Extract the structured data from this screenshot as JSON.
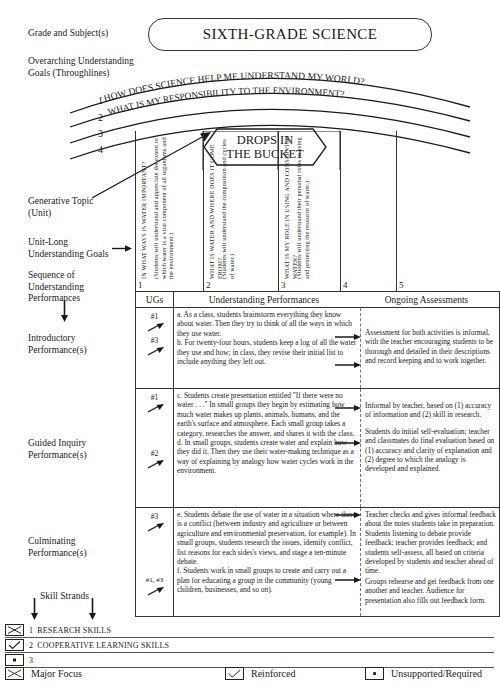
{
  "labels": {
    "grade_subject": "Grade and Subject(s)",
    "overarching": "Overarching Understanding\nGoals (Throughlines)",
    "generative_topic": "Generative Topic\n(Unit)",
    "unit_long": "Unit-Long\nUnderstanding Goals",
    "sequence": "Sequence of\nUnderstanding\nPerformances",
    "introductory": "Introductory\nPerformance(s)",
    "guided": "Guided Inquiry\nPerformance(s)",
    "culminating": "Culminating\nPerformance(s)",
    "skill_strands": "Skill Strands"
  },
  "title": "SIXTH-GRADE SCIENCE",
  "throughlines": {
    "numbers": [
      "1",
      "2",
      "3",
      "4"
    ],
    "arc_texts": [
      "HOW DOES SCIENCE HELP ME UNDERSTAND MY WORLD?",
      "WHAT IS MY RESPONSIBILITY TO THE ENVIRONMENT?"
    ]
  },
  "generative_topic": {
    "line1": "DROPS IN",
    "line2": "THE BUCKET"
  },
  "understanding_goals": [
    {
      "number": "1",
      "question": "IN WHAT WAYS IS WATER IMPORTANT?",
      "detail": "(Students will understand and appreciate the extent to which water is a vital component of all organisms and the environment.)"
    },
    {
      "number": "2",
      "question": "WHAT IS WATER AND WHERE DOES IT COME FROM?",
      "detail": "(Students will understand the composition and cycles of water.)"
    },
    {
      "number": "3",
      "question": "WHAT IS MY ROLE IN USING AND CONSERVING WATER?",
      "detail": "(Students will understand their personal roles in using and protecting the resource of water.)"
    },
    {
      "number": "4",
      "question": "",
      "detail": ""
    },
    {
      "number": "5",
      "question": "",
      "detail": ""
    }
  ],
  "table": {
    "headers": {
      "ugs": "UGs",
      "performances": "Understanding Performances",
      "assessments": "Ongoing Assessments"
    },
    "rows": [
      {
        "ug_marks": [
          "#1",
          "#3"
        ],
        "performance": "a. As a class, students brainstorm everything they know about water. Then they try to think of all the ways in which they use water.\nb. For twenty-four hours, students keep a log of all the water they use and how; in class, they revise their initial list to include anything they left out.",
        "assessments": [
          "Assessment for both activities is informal, with the teacher encouraging students to be thorough and detailed in their descriptions and record keeping and to work together."
        ]
      },
      {
        "ug_marks": [
          "#1",
          "#2"
        ],
        "performance": "c. Students create presentation entitled \"If there were no water . . .\" In small groups they begin by estimating how much water makes up plants, animals, humans, and the earth's surface and atmosphere. Each small group takes a category, researches the answer, and shares it with the class.\nd. In small groups, students create water and explain how they did it. Then they use their water-making technique as a way of explaining by analogy how water cycles work in the environment.",
        "assessments": [
          "Informal by teacher, based on (1) accuracy of information and (2) skill in research.",
          "Students do initial self-evaluation; teacher and classmates do final evaluation based on (1) accuracy and clarity of explanation and (2) degree to which the analogy is developed and explained."
        ]
      },
      {
        "ug_marks": [
          "#3",
          "#1, #3"
        ],
        "performance": "e. Students debate the use of water in a situation where there is a conflict (between industry and agriculture or between agriculture and environmental preservation, for example). In small groups, students research the issues, identify conflict, list reasons for each sides's views, and stage a ten-minute debate.\nf. Students work in small groups to create and carry out a plan for educating a group in the community (young children, businesses, and so on).",
        "assessments": [
          "Teacher checks and gives informal feedback about the notes students take in preparation. Students listening to debate provide feedback; teacher provides feedback; and students self-assess, all based on criteria developed by students and teacher ahead of time.",
          "Groups rehearse and get feedback from one another and teacher. Audience for presentation also fills out feedback form."
        ]
      }
    ]
  },
  "skill_strands": [
    {
      "icon": "x-box-icon",
      "number": "1",
      "label": "RESEARCH SKILLS"
    },
    {
      "icon": "check-box-icon",
      "number": "2",
      "label": "COOPERATIVE LEARNING SKILLS"
    },
    {
      "icon": "dot-box-icon",
      "number": "3",
      "label": ""
    }
  ],
  "legend": [
    {
      "icon": "x-box-icon",
      "label": "Major Focus"
    },
    {
      "icon": "check-box-icon",
      "label": "Reinforced"
    },
    {
      "icon": "dot-box-icon",
      "label": "Unsupported/Required"
    }
  ]
}
